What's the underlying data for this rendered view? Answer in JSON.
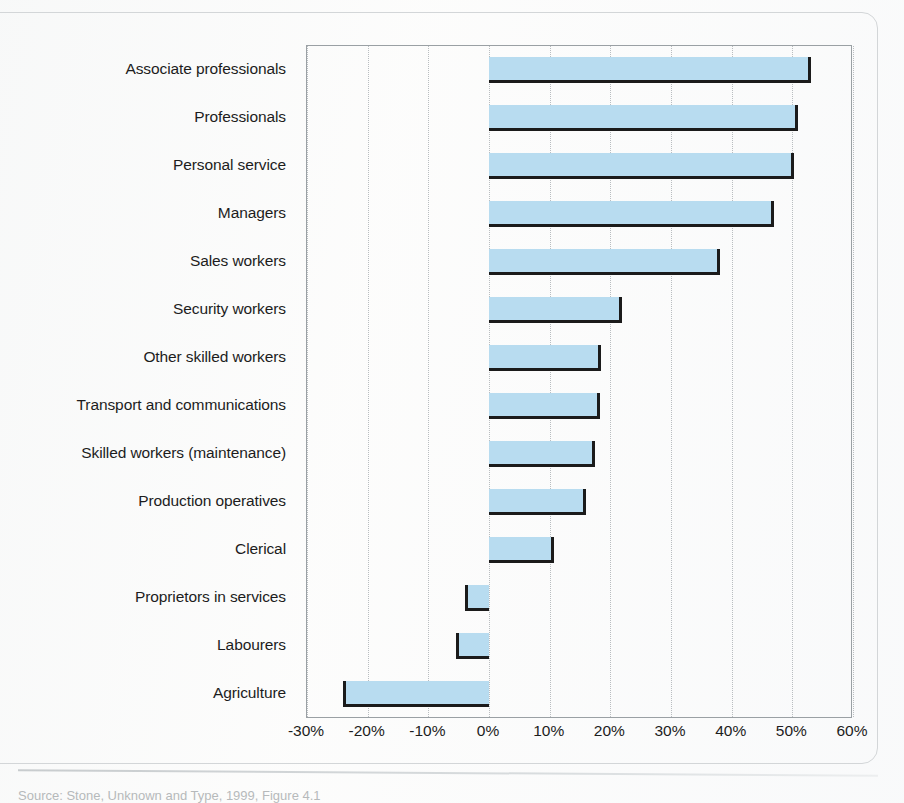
{
  "figure": {
    "caption": "Source: Stone, Unknown and Type, 1999, Figure 4.1"
  },
  "axis": {
    "ticks": [
      "-30%",
      "-20%",
      "-10%",
      "0%",
      "10%",
      "20%",
      "30%",
      "40%",
      "50%",
      "60%"
    ],
    "tick_values": [
      -30,
      -20,
      -10,
      0,
      10,
      20,
      30,
      40,
      50,
      60
    ],
    "min": -30,
    "max": 60,
    "step": 10
  },
  "style": {
    "bar_fill": "#b8dcf0",
    "bar_shadow": "#1b1b1b",
    "grid_color": "#b9bdc0",
    "plot_border": "#9aa0a4",
    "text_color": "#1d1d1d"
  },
  "chart_data": {
    "type": "bar",
    "orientation": "horizontal",
    "title": "",
    "xlabel": "",
    "ylabel": "",
    "xlim": [
      -30,
      60
    ],
    "grid": true,
    "legend": "none",
    "categories": [
      "Associate professionals",
      "Professionals",
      "Personal service",
      "Managers",
      "Sales workers",
      "Security workers",
      "Other skilled workers",
      "Transport and communications",
      "Skilled workers (maintenance)",
      "Production operatives",
      "Clerical",
      "Proprietors in services",
      "Labourers",
      "Agriculture"
    ],
    "values": [
      53,
      51,
      50.3,
      47,
      38,
      22,
      18.5,
      18.3,
      17.5,
      16,
      10.7,
      -4,
      -5.5,
      -24
    ],
    "value_labels": [
      "53%",
      "51%",
      "50%",
      "47%",
      "38%",
      "22%",
      "18%",
      "18%",
      "17%",
      "16%",
      "11%",
      "-4%",
      "-6%",
      "-24%"
    ]
  }
}
